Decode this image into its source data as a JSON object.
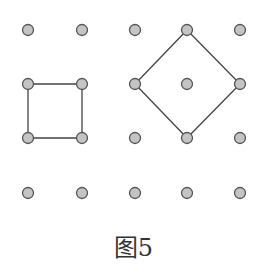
{
  "caption": "图5",
  "colors": {
    "dot_fill": "#c4c4c4",
    "dot_stroke": "#555555",
    "line": "#444444"
  },
  "grid": {
    "columns_x": [
      28,
      82,
      135,
      187,
      240
    ],
    "rows_y": [
      30,
      84,
      138,
      193
    ],
    "dot_radius": 5.5
  },
  "shapes": [
    {
      "name": "square",
      "points": [
        [
          0,
          1
        ],
        [
          1,
          1
        ],
        [
          1,
          2
        ],
        [
          0,
          2
        ]
      ]
    },
    {
      "name": "diamond",
      "points": [
        [
          3,
          0
        ],
        [
          4,
          1
        ],
        [
          3,
          2
        ],
        [
          2,
          1
        ]
      ]
    }
  ]
}
